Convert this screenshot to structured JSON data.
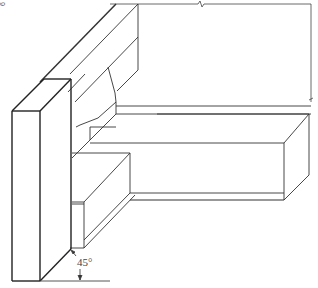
{
  "figure": {
    "type": "isometric line drawing",
    "edge_label": "6",
    "annotations": {
      "angle": "45°"
    },
    "colors": {
      "line": "#333333",
      "background": "#ffffff"
    }
  }
}
